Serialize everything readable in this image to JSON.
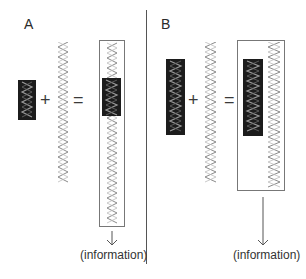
{
  "panels": {
    "a": {
      "label": "A",
      "output_label": "(information)"
    },
    "b": {
      "label": "B",
      "output_label": "(information)"
    }
  },
  "operators": {
    "plus": "+",
    "equals": "="
  },
  "colors": {
    "helix_stroke": "#8a8a8a",
    "dark_block": "#1c1c1c",
    "dark_block_helix": "#9a9a9a",
    "box_border": "#777777",
    "divider": "#555555"
  }
}
